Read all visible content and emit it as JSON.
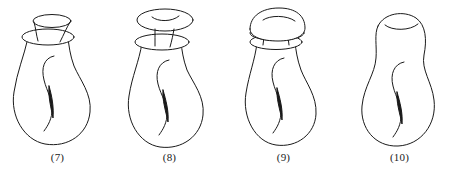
{
  "plate": {
    "kind": "line-drawing-figure-plate",
    "subject": "pitcher-shaped vessels with differing lid and collar structures",
    "background_color": "#ffffff",
    "ink_color": "#1a1a1a",
    "fill_color": "#ffffff",
    "stroke_width": 1,
    "figure_count": 4
  },
  "figures": [
    {
      "id": "fig-7",
      "caption": "(7)",
      "lid_type": "raised-funnel-cap",
      "has_collar": true,
      "has_lid_arc": false,
      "strut_count": 2,
      "body_shape": "pear-gourd",
      "has_inner-s-curve": true,
      "has_sliver": true
    },
    {
      "id": "fig-8",
      "caption": "(8)",
      "lid_type": "flat-disc-cap",
      "has_collar": true,
      "has_lid_arc": true,
      "strut_count": 2,
      "body_shape": "pear-gourd",
      "has_inner-s-curve": true,
      "has_sliver": true
    },
    {
      "id": "fig-9",
      "caption": "(9)",
      "lid_type": "dome-cap",
      "has_collar": true,
      "has_lid_arc": true,
      "strut_count": 2,
      "body_shape": "pear-gourd",
      "has_inner-s-curve": true,
      "has_sliver": true
    },
    {
      "id": "fig-10",
      "caption": "(10)",
      "lid_type": "open-rim",
      "has_collar": false,
      "has_lid_arc": true,
      "strut_count": 0,
      "body_shape": "hourglass-gourd",
      "has_inner-s-curve": true,
      "has_sliver": true
    }
  ]
}
